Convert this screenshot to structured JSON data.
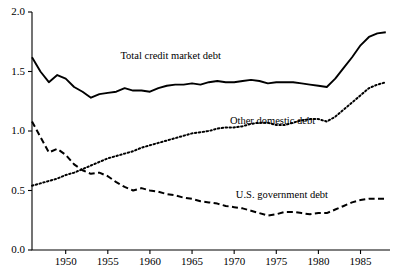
{
  "chart_data": {
    "type": "line",
    "title": "",
    "xlabel": "",
    "ylabel": "",
    "xlim": [
      1946,
      1988.5
    ],
    "ylim": [
      0.0,
      2.0
    ],
    "grid": false,
    "legend": "inline-annotations",
    "yticks": [
      "0.0",
      "0.5",
      "1.0",
      "1.5",
      "2.0"
    ],
    "ytick_values": [
      0.0,
      0.5,
      1.0,
      1.5,
      2.0
    ],
    "xticks": [
      "1950",
      "1955",
      "1960",
      "1965",
      "1970",
      "1975",
      "1980",
      "1985"
    ],
    "xtick_values": [
      1950,
      1955,
      1960,
      1965,
      1970,
      1975,
      1980,
      1985
    ],
    "x": [
      1946,
      1947,
      1948,
      1949,
      1950,
      1951,
      1952,
      1953,
      1954,
      1955,
      1956,
      1957,
      1958,
      1959,
      1960,
      1961,
      1962,
      1963,
      1964,
      1965,
      1966,
      1967,
      1968,
      1969,
      1970,
      1971,
      1972,
      1973,
      1974,
      1975,
      1976,
      1977,
      1978,
      1979,
      1980,
      1981,
      1982,
      1983,
      1984,
      1985,
      1986,
      1987,
      1988
    ],
    "series": [
      {
        "name": "Total credit market debt",
        "style": "solid",
        "color": "#000000",
        "label_x": 1956.5,
        "label_y": 1.63,
        "values": [
          1.62,
          1.5,
          1.41,
          1.47,
          1.44,
          1.37,
          1.33,
          1.28,
          1.31,
          1.32,
          1.33,
          1.36,
          1.34,
          1.34,
          1.33,
          1.36,
          1.38,
          1.39,
          1.39,
          1.4,
          1.39,
          1.41,
          1.42,
          1.41,
          1.41,
          1.42,
          1.43,
          1.42,
          1.4,
          1.41,
          1.41,
          1.41,
          1.4,
          1.39,
          1.38,
          1.37,
          1.44,
          1.53,
          1.62,
          1.72,
          1.79,
          1.82,
          1.83
        ]
      },
      {
        "name": "Other domestic debt",
        "style": "dotted",
        "color": "#000000",
        "label_x": 1969.5,
        "label_y": 1.08,
        "values": [
          0.54,
          0.56,
          0.58,
          0.6,
          0.63,
          0.65,
          0.68,
          0.71,
          0.74,
          0.77,
          0.79,
          0.81,
          0.83,
          0.86,
          0.88,
          0.9,
          0.92,
          0.94,
          0.96,
          0.98,
          0.99,
          1.0,
          1.02,
          1.03,
          1.03,
          1.04,
          1.06,
          1.07,
          1.07,
          1.05,
          1.05,
          1.07,
          1.09,
          1.1,
          1.1,
          1.08,
          1.12,
          1.18,
          1.24,
          1.3,
          1.36,
          1.39,
          1.41
        ]
      },
      {
        "name": "U.S. government debt",
        "style": "dashed",
        "color": "#000000",
        "label_x": 1970.2,
        "label_y": 0.46,
        "values": [
          1.08,
          0.95,
          0.82,
          0.85,
          0.8,
          0.72,
          0.67,
          0.64,
          0.65,
          0.62,
          0.57,
          0.53,
          0.5,
          0.52,
          0.5,
          0.49,
          0.47,
          0.46,
          0.44,
          0.43,
          0.41,
          0.4,
          0.39,
          0.37,
          0.36,
          0.35,
          0.33,
          0.31,
          0.29,
          0.3,
          0.32,
          0.32,
          0.31,
          0.3,
          0.31,
          0.31,
          0.34,
          0.37,
          0.4,
          0.42,
          0.43,
          0.43,
          0.43
        ]
      }
    ]
  }
}
